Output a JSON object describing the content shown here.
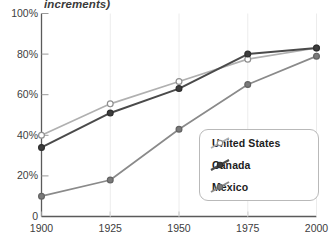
{
  "title_fragment": "increments)",
  "axes": {
    "y_ticks": [
      "100%",
      "80%",
      "60%",
      "40%",
      "20%",
      "0"
    ],
    "x_ticks": [
      "1900",
      "1925",
      "1950",
      "1975",
      "2000"
    ]
  },
  "legend": {
    "items": [
      {
        "label": "United States",
        "color": "#b0b0b0",
        "marker": "open-circle"
      },
      {
        "label": "Canada",
        "color": "#4a4a4a",
        "marker": "filled-circle"
      },
      {
        "label": "Mexico",
        "color": "#8a8a8a",
        "marker": "filled-circle"
      }
    ]
  },
  "chart_data": {
    "type": "line",
    "title": "increments)",
    "xlabel": "",
    "ylabel": "",
    "x": [
      1900,
      1925,
      1950,
      1975,
      2000
    ],
    "categories": [
      "1900",
      "1925",
      "1950",
      "1975",
      "2000"
    ],
    "xlim": [
      1900,
      2000
    ],
    "ylim": [
      0,
      100
    ],
    "ytick_values": [
      0,
      20,
      40,
      60,
      80,
      100
    ],
    "grid": false,
    "legend_position": "lower-right",
    "series": [
      {
        "name": "United States",
        "color": "#b0b0b0",
        "values": [
          40,
          55.5,
          66.5,
          77.5,
          83
        ]
      },
      {
        "name": "Canada",
        "color": "#4a4a4a",
        "values": [
          34,
          51,
          63,
          80,
          83
        ]
      },
      {
        "name": "Mexico",
        "color": "#8a8a8a",
        "values": [
          10,
          18,
          43,
          65,
          79
        ]
      }
    ]
  }
}
